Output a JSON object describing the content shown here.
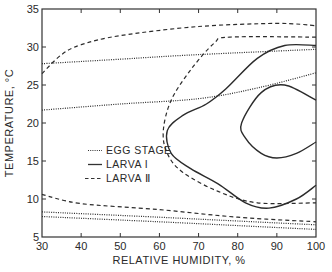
{
  "chart_data": {
    "type": "line",
    "title": "",
    "xlabel": "RELATIVE HUMIDITY, %",
    "ylabel": "TEMPERATURE, °C",
    "xlim": [
      30,
      100
    ],
    "ylim": [
      5,
      35
    ],
    "xticks": [
      30,
      40,
      50,
      60,
      70,
      80,
      90,
      100
    ],
    "yticks": [
      5,
      10,
      15,
      20,
      25,
      30,
      35
    ],
    "grid": false,
    "legend_position": "inside-left-middle",
    "legend": [
      {
        "label": "EGG STAGE",
        "style": "dotted"
      },
      {
        "label": "LARVA I",
        "style": "solid"
      },
      {
        "label": "LARVA Ⅱ",
        "style": "dashed"
      }
    ],
    "series": [
      {
        "name": "EGG STAGE",
        "style": "dotted",
        "segment": "upper-bound",
        "points": [
          [
            30,
            27.8
          ],
          [
            50,
            28.4
          ],
          [
            70,
            29.0
          ],
          [
            100,
            29.7
          ]
        ]
      },
      {
        "name": "EGG STAGE",
        "style": "dotted",
        "segment": "lower-optimum-bound",
        "points": [
          [
            30,
            21.7
          ],
          [
            50,
            22.5
          ],
          [
            70,
            23.2
          ],
          [
            85,
            24.6
          ],
          [
            100,
            26.6
          ]
        ]
      },
      {
        "name": "EGG STAGE",
        "style": "dotted",
        "segment": "low-bound-1",
        "points": [
          [
            30,
            8.3
          ],
          [
            60,
            7.6
          ],
          [
            80,
            7.1
          ],
          [
            100,
            6.6
          ]
        ]
      },
      {
        "name": "EGG STAGE",
        "style": "dotted",
        "segment": "low-bound-2",
        "points": [
          [
            30,
            7.7
          ],
          [
            60,
            7.0
          ],
          [
            80,
            6.5
          ],
          [
            100,
            6.0
          ]
        ]
      },
      {
        "name": "LARVA Ⅱ",
        "style": "dashed",
        "segment": "upper-bound",
        "points": [
          [
            30,
            26.5
          ],
          [
            35,
            29
          ],
          [
            40,
            30.3
          ],
          [
            50,
            31.5
          ],
          [
            70,
            32.7
          ],
          [
            90,
            33.1
          ],
          [
            100,
            32.8
          ]
        ]
      },
      {
        "name": "LARVA Ⅱ",
        "style": "dashed",
        "segment": "optimum-envelope",
        "points": [
          [
            100,
            31.3
          ],
          [
            78,
            31.3
          ],
          [
            74,
            30.5
          ],
          [
            68,
            27
          ],
          [
            63,
            23
          ],
          [
            61,
            19
          ],
          [
            62,
            16
          ],
          [
            66,
            13.5
          ],
          [
            75,
            11
          ],
          [
            85,
            9.5
          ],
          [
            100,
            9.5
          ]
        ]
      },
      {
        "name": "LARVA Ⅱ",
        "style": "dashed",
        "segment": "lower-bound",
        "points": [
          [
            30,
            10.6
          ],
          [
            40,
            9.4
          ],
          [
            60,
            8.6
          ],
          [
            80,
            7.6
          ],
          [
            100,
            7.0
          ]
        ]
      },
      {
        "name": "LARVA I",
        "style": "solid",
        "segment": "outer-envelope",
        "points": [
          [
            100,
            30.2
          ],
          [
            92,
            30.2
          ],
          [
            85,
            28.5
          ],
          [
            77,
            24.5
          ],
          [
            72,
            22.5
          ],
          [
            66,
            21
          ],
          [
            62,
            19
          ],
          [
            63,
            16
          ],
          [
            68,
            14
          ],
          [
            75,
            12
          ],
          [
            82,
            9.5
          ],
          [
            88,
            8.8
          ],
          [
            95,
            10
          ],
          [
            100,
            11.8
          ]
        ]
      },
      {
        "name": "LARVA I",
        "style": "solid",
        "segment": "inner-optimum",
        "points": [
          [
            100,
            23
          ],
          [
            92,
            25
          ],
          [
            86,
            24
          ],
          [
            81,
            20
          ],
          [
            82,
            18
          ],
          [
            86,
            16
          ],
          [
            90,
            15.4
          ],
          [
            95,
            16
          ],
          [
            100,
            17.5
          ]
        ]
      }
    ]
  },
  "plot": {
    "left": 42,
    "right": 316,
    "top": 9,
    "bottom": 237
  }
}
